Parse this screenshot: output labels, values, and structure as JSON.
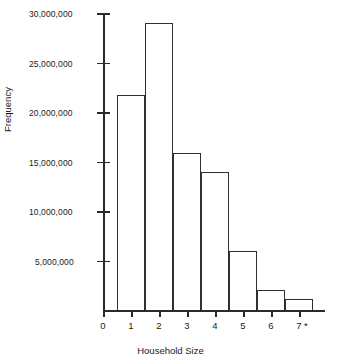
{
  "chart_data": {
    "type": "bar",
    "title": "",
    "subtitle": "",
    "xlabel": "Household Size",
    "ylabel": "Frequency",
    "categories": [
      "1",
      "2",
      "3",
      "4",
      "5",
      "6",
      "7 *"
    ],
    "values": [
      21800000,
      29100000,
      16000000,
      14000000,
      6100000,
      2100000,
      1200000
    ],
    "series": [
      {
        "name": "Frequency",
        "values": [
          21800000,
          29100000,
          16000000,
          14000000,
          6100000,
          2100000,
          1200000
        ]
      }
    ],
    "x_tick_labels": [
      "0",
      "1",
      "2",
      "3",
      "4",
      "5",
      "6",
      "7 *"
    ],
    "y_tick_labels": [
      "5,000,000",
      "10,000,000",
      "15,000,000",
      "20,000,000",
      "25,000,000",
      "30,000,000"
    ],
    "y_tick_values": [
      5000000,
      10000000,
      15000000,
      20000000,
      25000000,
      30000000
    ],
    "ylim": [
      0,
      30000000
    ],
    "xlim": [
      0,
      7.5
    ],
    "grid": false,
    "legend": "none",
    "bar_fill": "#ffffff",
    "bar_edge": "#2f2f2f",
    "axis_color": "#2a2a2a",
    "text_color": "#1a1a1a",
    "background": "#ffffff",
    "annotations": [
      "*"
    ]
  },
  "axes": {
    "y_title": "Frequency",
    "x_title": "Household Size"
  },
  "y_ticks": [
    {
      "label": "30,000,000",
      "value": 30000000
    },
    {
      "label": "25,000,000",
      "value": 25000000
    },
    {
      "label": "20,000,000",
      "value": 20000000
    },
    {
      "label": "15,000,000",
      "value": 15000000
    },
    {
      "label": "10,000,000",
      "value": 10000000
    },
    {
      "label": "5,000,000",
      "value": 5000000
    }
  ],
  "x_ticks": [
    {
      "label": "0"
    },
    {
      "label": "1"
    },
    {
      "label": "2"
    },
    {
      "label": "3"
    },
    {
      "label": "4"
    },
    {
      "label": "5"
    },
    {
      "label": "6"
    },
    {
      "label": "7 *"
    }
  ],
  "bars": [
    {
      "label": "1",
      "value": 21800000
    },
    {
      "label": "2",
      "value": 29100000
    },
    {
      "label": "3",
      "value": 16000000
    },
    {
      "label": "4",
      "value": 14000000
    },
    {
      "label": "5",
      "value": 6100000
    },
    {
      "label": "6",
      "value": 2100000
    },
    {
      "label": "7 *",
      "value": 1200000
    }
  ]
}
